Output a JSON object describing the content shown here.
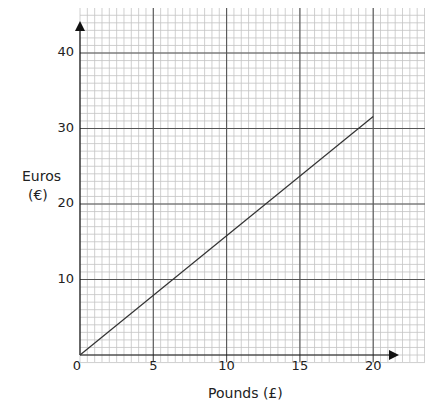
{
  "chart_data": {
    "type": "line",
    "title": "",
    "xlabel": "Pounds (£)",
    "ylabel_line1": "Euros",
    "ylabel_line2": "(€)",
    "xlim": [
      0,
      23.6
    ],
    "ylim": [
      0,
      46
    ],
    "x_ticks": [
      0,
      5,
      10,
      15,
      20
    ],
    "y_ticks": [
      10,
      20,
      30,
      40
    ],
    "x_tick_labels": [
      "0",
      "5",
      "10",
      "15",
      "20"
    ],
    "y_tick_labels": [
      "10",
      "20",
      "30",
      "40"
    ],
    "grid": {
      "major_x": 5,
      "minor_x": 0.5,
      "major_y": 10,
      "minor_y": 1
    },
    "series": [
      {
        "name": "Conversion",
        "x": [
          0,
          20
        ],
        "y": [
          0,
          31.6
        ]
      }
    ],
    "colors": {
      "line": "#333333",
      "major_grid": "#555555",
      "minor_grid": "#c4c4c4",
      "axis": "#111111"
    }
  }
}
